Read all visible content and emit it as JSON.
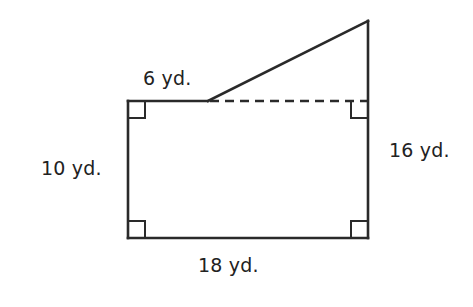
{
  "figure": {
    "type": "composite-figure",
    "stroke_color": "#2a2a2a",
    "background_color": "#ffffff",
    "labels": {
      "top_segment": "6 yd.",
      "left_side": "10 yd.",
      "right_side": "16 yd.",
      "bottom_side": "18 yd."
    },
    "dimensions": {
      "top_segment_yd": 6,
      "left_side_yd": 10,
      "right_side_yd": 16,
      "bottom_side_yd": 18
    },
    "right_angle_markers": [
      "top-left",
      "top-right",
      "bottom-left",
      "bottom-right"
    ],
    "dashed_line": "separates rectangle from triangle"
  }
}
